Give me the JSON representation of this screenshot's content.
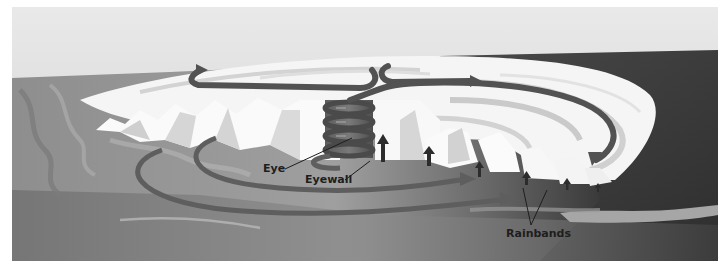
{
  "figure": {
    "labels": {
      "eye": "Eye",
      "eyewall": "Eyewall",
      "rainbands": "Rainbands"
    },
    "colors": {
      "sky_top": "#e8e8e8",
      "sky_bottom": "#d2d2d2",
      "ocean_light": "#9a9a9a",
      "ocean_dark": "#3e3e3e",
      "cloud_white": "#f7f7f7",
      "cloud_gray": "#cfcfcf",
      "arrow_band": "#5a5a5a",
      "updraft_arrow": "#2c2c2c",
      "label_text": "#1e1e1e"
    }
  }
}
